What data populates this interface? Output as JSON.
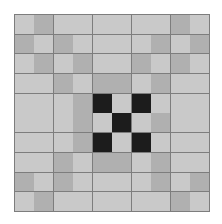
{
  "image": {
    "title": "Quilt Block Pattern",
    "description": "Concentric square quilt block with nine-patch X center",
    "width": 222,
    "height": 224
  },
  "canvas": {
    "background": "#ffffff"
  },
  "block": {
    "name": "quilt-block",
    "origin_x": 14,
    "origin_y": 14,
    "width": 196,
    "height": 198,
    "rows": 10,
    "columns": 10,
    "gridline_color": "#7d7d7d",
    "gridline_width": 0.9
  },
  "palette": {
    "light": "#c9c9c9",
    "medium": "#b0b0b0",
    "dark": "#1c1c1c",
    "gridline": "#7d7d7d"
  },
  "legend": [
    {
      "key": "light",
      "label": "Light Gray",
      "color": "#c9c9c9"
    },
    {
      "key": "medium",
      "label": "Medium Gray",
      "color": "#b0b0b0"
    },
    {
      "key": "dark",
      "label": "Dark",
      "color": "#1c1c1c"
    }
  ],
  "chart_data": {
    "type": "heatmap",
    "xlabel": "",
    "ylabel": "",
    "categories": [
      "c0",
      "c1",
      "c2",
      "c3",
      "c4",
      "c5",
      "c6",
      "c7",
      "c8",
      "c9"
    ],
    "row_labels": [
      "r0",
      "r1",
      "r2",
      "r3",
      "r4",
      "r5",
      "r6",
      "r7",
      "r8",
      "r9"
    ],
    "value_colors": {
      "0": "#c9c9c9",
      "1": "#b0b0b0",
      "2": "#1c1c1c"
    },
    "value_labels": {
      "0": "light",
      "1": "medium",
      "2": "dark"
    },
    "grid": true,
    "legend_position": "none",
    "values": [
      [
        0,
        1,
        0,
        0,
        0,
        0,
        0,
        0,
        1,
        0
      ],
      [
        1,
        0,
        1,
        0,
        0,
        0,
        0,
        1,
        0,
        1
      ],
      [
        0,
        1,
        0,
        1,
        0,
        0,
        1,
        0,
        1,
        0
      ],
      [
        0,
        0,
        1,
        0,
        1,
        1,
        0,
        1,
        0,
        0
      ],
      [
        0,
        0,
        0,
        1,
        2,
        0,
        2,
        0,
        0,
        0
      ],
      [
        0,
        0,
        0,
        1,
        0,
        2,
        0,
        1,
        0,
        0
      ],
      [
        0,
        0,
        0,
        1,
        2,
        0,
        2,
        0,
        0,
        0
      ],
      [
        0,
        0,
        1,
        0,
        1,
        1,
        0,
        1,
        0,
        0
      ],
      [
        1,
        0,
        1,
        0,
        0,
        0,
        0,
        1,
        0,
        1
      ],
      [
        0,
        1,
        0,
        0,
        0,
        0,
        0,
        0,
        1,
        0
      ]
    ]
  }
}
